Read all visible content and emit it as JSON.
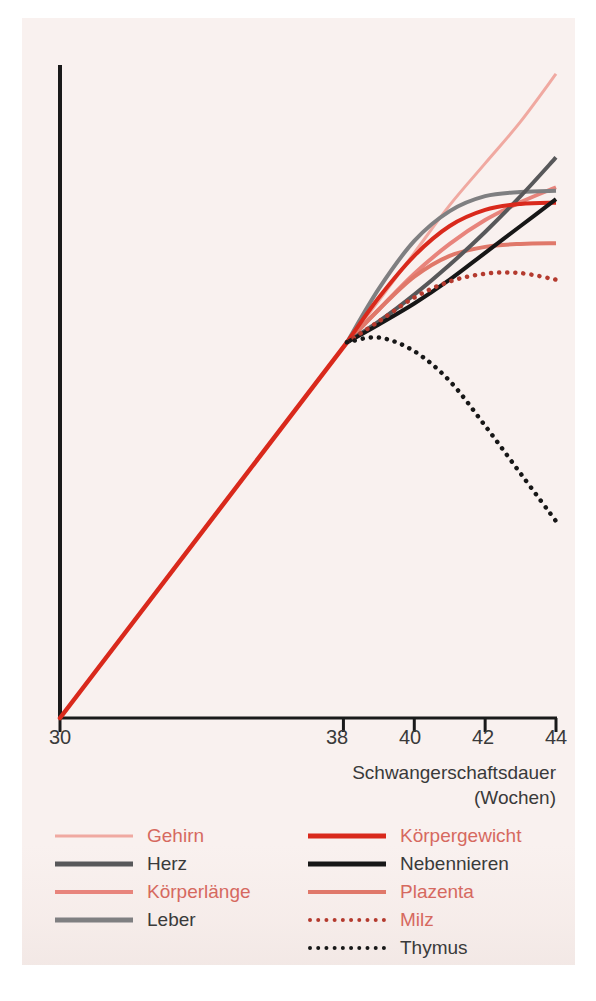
{
  "chart_data": {
    "type": "line",
    "title": "",
    "xlabel": "Schwangerschaftsdauer (Wochen)",
    "xlabel_line1": "Schwangerschaftsdauer",
    "xlabel_line2": "(Wochen)",
    "ylabel": "",
    "xlim": [
      30,
      44
    ],
    "ylim": [
      0,
      100
    ],
    "grid": false,
    "legend_position": "below-plot",
    "x_ticks": [
      30,
      38,
      40,
      42,
      44
    ],
    "x_tick_labels": [
      "30",
      "38",
      "40",
      "42",
      "44"
    ],
    "y_ticks": [],
    "y_tick_labels": [],
    "note": "All series share a single common growth trajectory from week 30 to ~week 38.1, then diverge.",
    "common_segment": {
      "x": [
        30,
        38.1
      ],
      "y": [
        0,
        63
      ]
    },
    "series": [
      {
        "name": "Gehirn",
        "color": "#f0a9a1",
        "style": "solid",
        "width": 3,
        "x": [
          38.1,
          39.0,
          40.0,
          41.0,
          42.0,
          43.0,
          44.0
        ],
        "y": [
          63,
          70,
          78,
          86,
          93,
          100,
          108
        ]
      },
      {
        "name": "Herz",
        "color": "#58585a",
        "style": "solid",
        "width": 4,
        "x": [
          38.1,
          39.0,
          40.0,
          41.0,
          42.0,
          43.0,
          44.0
        ],
        "y": [
          63,
          66.5,
          71,
          76,
          81.5,
          87.5,
          94
        ]
      },
      {
        "name": "Körperlänge",
        "color": "#e8847c",
        "style": "solid",
        "width": 4,
        "x": [
          38.1,
          39.0,
          40.0,
          41.0,
          42.0,
          43.0,
          44.0
        ],
        "y": [
          63,
          68.5,
          74.5,
          79.5,
          83.5,
          86.5,
          89
        ]
      },
      {
        "name": "Leber",
        "color": "#7f7f81",
        "style": "solid",
        "width": 4,
        "x": [
          38.1,
          39.0,
          40.0,
          41.0,
          42.0,
          43.0,
          44.0
        ],
        "y": [
          63,
          72,
          80,
          85,
          87.5,
          88.2,
          88.4
        ]
      },
      {
        "name": "Körpergewicht",
        "color": "#d9291c",
        "style": "solid",
        "width": 4,
        "x": [
          38.1,
          39.0,
          40.0,
          41.0,
          42.0,
          43.0,
          44.0
        ],
        "y": [
          63,
          70.5,
          77.5,
          82.5,
          85.2,
          86.2,
          86.4
        ]
      },
      {
        "name": "Nebennieren",
        "color": "#171717",
        "style": "solid",
        "width": 4,
        "x": [
          38.1,
          39.0,
          40.0,
          41.0,
          42.0,
          43.0,
          44.0
        ],
        "y": [
          63,
          66,
          69.5,
          73.5,
          78,
          82.5,
          87
        ]
      },
      {
        "name": "Plazenta",
        "color": "#e0786a",
        "style": "solid",
        "width": 4,
        "x": [
          38.1,
          39.0,
          40.0,
          41.0,
          42.0,
          43.0,
          44.0
        ],
        "y": [
          63,
          68.5,
          74,
          77.5,
          79,
          79.5,
          79.6
        ]
      },
      {
        "name": "Milz",
        "color": "#b43a2e",
        "style": "dotted",
        "width": 4,
        "x": [
          38.1,
          39.0,
          40.0,
          41.0,
          42.0,
          43.0,
          44.0
        ],
        "y": [
          63,
          66.5,
          70.5,
          73.2,
          74.5,
          74.6,
          73.5
        ]
      },
      {
        "name": "Thymus",
        "color": "#171717",
        "style": "dotted",
        "width": 4,
        "x": [
          38.1,
          39.0,
          40.0,
          41.0,
          42.0,
          43.0,
          44.0
        ],
        "y": [
          63,
          63.8,
          61.5,
          56.5,
          49,
          41,
          33
        ]
      }
    ]
  },
  "axis": {
    "tick_30": "30",
    "tick_38": "38",
    "tick_40": "40",
    "tick_42": "42",
    "tick_44": "44",
    "title_line1": "Schwangerschaftsdauer",
    "title_line2": "(Wochen)"
  },
  "legend": {
    "left_column": [
      {
        "label": "Gehirn",
        "color": "#f0a9a1",
        "style": "solid",
        "text_color": "#d6695f",
        "width": 3
      },
      {
        "label": "Herz",
        "color": "#58585a",
        "style": "solid",
        "text_color": "#3a3a3a",
        "width": 5
      },
      {
        "label": "Körperlänge",
        "color": "#e8847c",
        "style": "solid",
        "text_color": "#d6695f",
        "width": 4
      },
      {
        "label": "Leber",
        "color": "#7f7f81",
        "style": "solid",
        "text_color": "#3a3a3a",
        "width": 5
      }
    ],
    "right_column": [
      {
        "label": "Körpergewicht",
        "color": "#d9291c",
        "style": "solid",
        "text_color": "#d6695f",
        "width": 5
      },
      {
        "label": "Nebennieren",
        "color": "#171717",
        "style": "solid",
        "text_color": "#3a3a3a",
        "width": 5
      },
      {
        "label": "Plazenta",
        "color": "#e0786a",
        "style": "solid",
        "text_color": "#d6695f",
        "width": 4
      },
      {
        "label": "Milz",
        "color": "#b43a2e",
        "style": "dotted",
        "text_color": "#d6695f",
        "width": 4
      },
      {
        "label": "Thymus",
        "color": "#171717",
        "style": "dotted",
        "text_color": "#3a3a3a",
        "width": 4
      }
    ]
  },
  "colors": {
    "panel_background": "#f9f1ef",
    "page_background": "#ffffff",
    "axis": "#1a1a1a",
    "text": "#3a3a3a"
  }
}
